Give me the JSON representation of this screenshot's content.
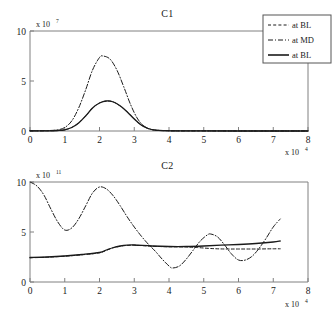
{
  "figure": {
    "background": "#ffffff",
    "line_color": "#1a1a1a",
    "axis_color": "#808080"
  },
  "legend": {
    "position": "top-right",
    "entries": [
      {
        "label": "at BL",
        "style": "dashed",
        "icon": "dashed-line-icon"
      },
      {
        "label": "at MD",
        "style": "dashdot",
        "icon": "dashdot-line-icon"
      },
      {
        "label": "at BL",
        "style": "solid",
        "icon": "solid-line-icon"
      }
    ]
  },
  "chart_data": [
    {
      "type": "line",
      "title": "C1",
      "xlabel": "x 10",
      "xlabel_exp": "4",
      "ylabel": "",
      "y_exp_prefix": "x 10",
      "y_exp": "7",
      "xlim": [
        0,
        8
      ],
      "ylim": [
        0,
        10
      ],
      "xticks": [
        0,
        1,
        2,
        3,
        4,
        5,
        6,
        7,
        8
      ],
      "xticklabels": [
        "0",
        "1",
        "2",
        "3",
        "4",
        "5",
        "6",
        "7",
        "8"
      ],
      "yticks": [
        0,
        5,
        10
      ],
      "yticklabels": [
        "0",
        "5",
        "10"
      ],
      "grid": false,
      "x_scale_note": "values in units of 1e4",
      "y_scale_note": "values in units of 1e7",
      "series": [
        {
          "name": "at MD",
          "style": "dashdot",
          "x": [
            0,
            0.5,
            0.8,
            1.0,
            1.2,
            1.4,
            1.6,
            1.8,
            2.0,
            2.1,
            2.3,
            2.5,
            2.7,
            2.9,
            3.1,
            3.3,
            3.5,
            3.8,
            4.2,
            5.0,
            6.0,
            7.2,
            8.0
          ],
          "values": [
            0.02,
            0.04,
            0.12,
            0.35,
            1.0,
            2.3,
            4.1,
            6.1,
            7.35,
            7.5,
            7.2,
            6.1,
            4.4,
            2.6,
            1.2,
            0.45,
            0.15,
            0.05,
            0.02,
            0.01,
            0.01,
            0.01,
            0.01
          ]
        },
        {
          "name": "at BL",
          "style": "dashed",
          "x": [
            0,
            0.5,
            0.8,
            1.0,
            1.2,
            1.4,
            1.6,
            1.8,
            2.0,
            2.2,
            2.4,
            2.6,
            2.8,
            3.0,
            3.2,
            3.4,
            3.6,
            3.9,
            4.3,
            5.0,
            6.0,
            7.2,
            8.0
          ],
          "values": [
            0.01,
            0.02,
            0.05,
            0.12,
            0.35,
            0.8,
            1.5,
            2.3,
            2.8,
            3.0,
            2.9,
            2.5,
            1.9,
            1.2,
            0.6,
            0.25,
            0.08,
            0.03,
            0.01,
            0.01,
            0.0,
            0.0,
            0.0
          ]
        },
        {
          "name": "at BL",
          "style": "solid",
          "x": [
            0,
            0.5,
            0.8,
            1.0,
            1.2,
            1.4,
            1.6,
            1.8,
            2.0,
            2.2,
            2.4,
            2.6,
            2.8,
            3.0,
            3.2,
            3.4,
            3.6,
            3.9,
            4.3,
            5.0,
            6.0,
            7.2,
            8.0
          ],
          "values": [
            0.01,
            0.02,
            0.05,
            0.12,
            0.35,
            0.8,
            1.5,
            2.3,
            2.8,
            3.0,
            2.9,
            2.5,
            1.9,
            1.2,
            0.6,
            0.25,
            0.08,
            0.03,
            0.01,
            0.01,
            0.0,
            0.0,
            0.0
          ]
        }
      ]
    },
    {
      "type": "line",
      "title": "C2",
      "xlabel": "x 10",
      "xlabel_exp": "4",
      "ylabel": "",
      "y_exp_prefix": "x 10",
      "y_exp": "11",
      "xlim": [
        0,
        8
      ],
      "ylim": [
        0,
        10
      ],
      "xticks": [
        0,
        1,
        2,
        3,
        4,
        5,
        6,
        7,
        8
      ],
      "xticklabels": [
        "0",
        "1",
        "2",
        "3",
        "4",
        "5",
        "6",
        "7",
        "8"
      ],
      "yticks": [
        0,
        5,
        10
      ],
      "yticklabels": [
        "0",
        "5",
        "10"
      ],
      "grid": false,
      "x_scale_note": "values in units of 1e4",
      "y_scale_note": "values in units of 1e11",
      "series": [
        {
          "name": "at MD",
          "style": "dashdot",
          "x": [
            0,
            0.2,
            0.4,
            0.6,
            0.8,
            1.0,
            1.2,
            1.4,
            1.6,
            1.8,
            2.0,
            2.2,
            2.4,
            2.6,
            2.8,
            3.0,
            3.2,
            3.4,
            3.6,
            3.8,
            4.0,
            4.1,
            4.3,
            4.5,
            4.7,
            4.9,
            5.1,
            5.2,
            5.4,
            5.6,
            5.8,
            6.0,
            6.2,
            6.4,
            6.6,
            6.8,
            7.0,
            7.2
          ],
          "values": [
            10.0,
            9.6,
            8.7,
            7.3,
            6.0,
            5.2,
            5.4,
            6.3,
            7.6,
            8.9,
            9.5,
            9.3,
            8.6,
            7.6,
            6.5,
            5.5,
            4.6,
            3.8,
            3.1,
            2.3,
            1.6,
            1.4,
            1.6,
            2.3,
            3.2,
            4.1,
            4.7,
            4.8,
            4.5,
            3.7,
            2.8,
            2.2,
            2.2,
            2.6,
            3.4,
            4.4,
            5.5,
            6.3
          ]
        },
        {
          "name": "at BL",
          "style": "solid",
          "x": [
            0,
            0.5,
            1.0,
            1.5,
            2.0,
            2.2,
            2.4,
            2.6,
            2.8,
            3.0,
            3.5,
            4.0,
            4.5,
            5.0,
            5.5,
            6.0,
            6.5,
            7.0,
            7.2
          ],
          "values": [
            2.45,
            2.5,
            2.6,
            2.75,
            2.95,
            3.2,
            3.45,
            3.6,
            3.68,
            3.7,
            3.6,
            3.55,
            3.55,
            3.6,
            3.68,
            3.75,
            3.85,
            4.0,
            4.1
          ]
        },
        {
          "name": "at BL",
          "style": "dashed",
          "x": [
            0,
            0.5,
            1.0,
            1.5,
            2.0,
            2.2,
            2.4,
            2.6,
            2.8,
            3.0,
            3.5,
            4.0,
            4.5,
            4.8,
            5.2,
            5.6,
            6.0,
            6.5,
            7.0,
            7.2
          ],
          "values": [
            2.42,
            2.48,
            2.58,
            2.72,
            2.92,
            3.18,
            3.42,
            3.58,
            3.66,
            3.68,
            3.58,
            3.52,
            3.5,
            3.45,
            3.35,
            3.3,
            3.3,
            3.3,
            3.32,
            3.32
          ]
        }
      ]
    }
  ]
}
